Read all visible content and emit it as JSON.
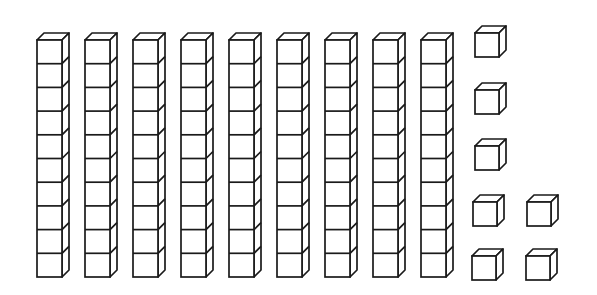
{
  "diagram": {
    "type": "base-ten-blocks",
    "description": "Base ten blocks: 9 ten-rods and 7 unit cubes",
    "stroke_color": "#1a1a1a",
    "fill_color": "#ffffff",
    "background_color": "#ffffff",
    "tens": {
      "label": "tens",
      "count": 9,
      "cubes_per_rod": 10,
      "rods": [
        {
          "x": 37,
          "y": 40
        },
        {
          "x": 85,
          "y": 40
        },
        {
          "x": 133,
          "y": 40
        },
        {
          "x": 181,
          "y": 40
        },
        {
          "x": 229,
          "y": 40
        },
        {
          "x": 277,
          "y": 40
        },
        {
          "x": 325,
          "y": 40
        },
        {
          "x": 373,
          "y": 40
        },
        {
          "x": 421,
          "y": 40
        }
      ],
      "rod_width": 25,
      "cube_height": 23.7,
      "depth": 7
    },
    "ones": {
      "label": "ones",
      "count": 7,
      "cube_size": 24,
      "depth": 7,
      "cubes": [
        {
          "x": 475,
          "y": 33
        },
        {
          "x": 475,
          "y": 90
        },
        {
          "x": 475,
          "y": 146
        },
        {
          "x": 473,
          "y": 202
        },
        {
          "x": 527,
          "y": 202
        },
        {
          "x": 472,
          "y": 256
        },
        {
          "x": 526,
          "y": 256
        }
      ]
    },
    "value_represented": "97"
  }
}
